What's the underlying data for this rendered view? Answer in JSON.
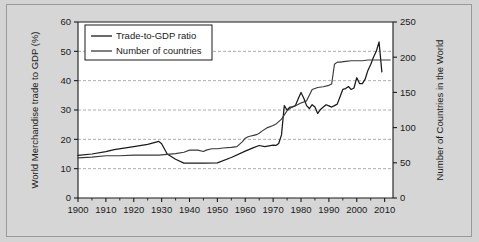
{
  "figure": {
    "background_color": "#d4d4d4",
    "plot_background_color": "#ffffff",
    "frame_color": "#9a9a9a"
  },
  "chart_data": {
    "type": "line",
    "title": "",
    "subtitle": "",
    "xlabel": "",
    "ylabel": "World Merchandise trade to GDP (%)",
    "y2label": "Number of Countries in the World",
    "xlim": [
      1900,
      2013
    ],
    "ylim": [
      0,
      60
    ],
    "y2lim": [
      0,
      250
    ],
    "xticks": [
      1900,
      1910,
      1920,
      1930,
      1940,
      1950,
      1960,
      1970,
      1980,
      1990,
      2000,
      2010
    ],
    "xtick_labels": [
      "1900",
      "1910",
      "1920",
      "1930",
      "1940",
      "1950",
      "1960",
      "1970",
      "1980",
      "1990",
      "2000",
      "2010"
    ],
    "yticks": [
      0,
      10,
      20,
      30,
      40,
      50,
      60
    ],
    "ytick_labels": [
      "0",
      "10",
      "20",
      "30",
      "40",
      "50",
      "60"
    ],
    "y2ticks": [
      0,
      50,
      100,
      150,
      200,
      250
    ],
    "y2tick_labels": [
      "0",
      "50",
      "100",
      "150",
      "200",
      "250"
    ],
    "grid": true,
    "grid_style": "dashed-horizontal",
    "legend_position": "top-left",
    "line_color": "#1a1a1a",
    "series": [
      {
        "name": "Trade-to-GDP ratio",
        "axis": "left",
        "color": "#1a1a1a",
        "x": [
          1900,
          1905,
          1910,
          1913,
          1920,
          1925,
          1929,
          1930,
          1932,
          1935,
          1938,
          1940,
          1945,
          1950,
          1955,
          1960,
          1963,
          1965,
          1967,
          1970,
          1971,
          1972,
          1973,
          1974,
          1975,
          1976,
          1977,
          1978,
          1979,
          1980,
          1981,
          1982,
          1983,
          1984,
          1985,
          1986,
          1987,
          1988,
          1989,
          1990,
          1991,
          1992,
          1993,
          1994,
          1995,
          1996,
          1997,
          1998,
          1999,
          2000,
          2001,
          2002,
          2003,
          2004,
          2005,
          2006,
          2007,
          2008,
          2009
        ],
        "values": [
          14.5,
          15.0,
          15.8,
          16.5,
          17.5,
          18.3,
          19.3,
          18.5,
          15.0,
          13.2,
          11.9,
          11.9,
          11.9,
          12.0,
          13.8,
          16.0,
          17.2,
          17.9,
          17.5,
          18.0,
          17.9,
          18.6,
          21.5,
          31.5,
          30.0,
          31.0,
          31.0,
          31.5,
          33.8,
          36.0,
          34.0,
          31.5,
          30.5,
          31.8,
          31.0,
          28.8,
          30.2,
          31.0,
          31.8,
          31.4,
          31.0,
          31.5,
          32.0,
          34.5,
          37.0,
          37.3,
          38.0,
          37.0,
          37.5,
          41.0,
          39.0,
          39.0,
          40.5,
          43.5,
          45.5,
          48.0,
          50.0,
          53.2,
          43.0
        ]
      },
      {
        "name": "Number of countries",
        "axis": "right",
        "color": "#3a3a3a",
        "x": [
          1900,
          1905,
          1910,
          1915,
          1920,
          1925,
          1929,
          1932,
          1935,
          1938,
          1940,
          1943,
          1945,
          1946,
          1948,
          1950,
          1952,
          1955,
          1957,
          1959,
          1960,
          1961,
          1962,
          1963,
          1964,
          1965,
          1966,
          1968,
          1970,
          1971,
          1973,
          1974,
          1975,
          1976,
          1977,
          1978,
          1980,
          1982,
          1984,
          1986,
          1988,
          1990,
          1991,
          1992,
          1993,
          1994,
          1996,
          1998,
          2000,
          2002,
          2004,
          2006,
          2008,
          2010,
          2012
        ],
        "values": [
          57,
          58,
          60,
          60,
          61,
          61,
          61,
          62,
          63,
          65,
          68,
          68,
          66,
          68,
          70,
          70,
          71,
          72,
          73,
          80,
          85,
          87,
          88,
          89,
          90,
          92,
          95,
          100,
          103,
          105,
          112,
          118,
          124,
          127,
          130,
          131,
          135,
          138,
          154,
          157,
          158,
          160,
          162,
          190,
          193,
          193,
          194,
          195,
          195,
          195,
          196,
          196,
          196,
          196,
          196
        ]
      }
    ],
    "legend_entries": [
      {
        "label": "Trade-to-GDP ratio",
        "color": "#1a1a1a"
      },
      {
        "label": "Number of countries",
        "color": "#3a3a3a"
      }
    ],
    "annotations": []
  }
}
